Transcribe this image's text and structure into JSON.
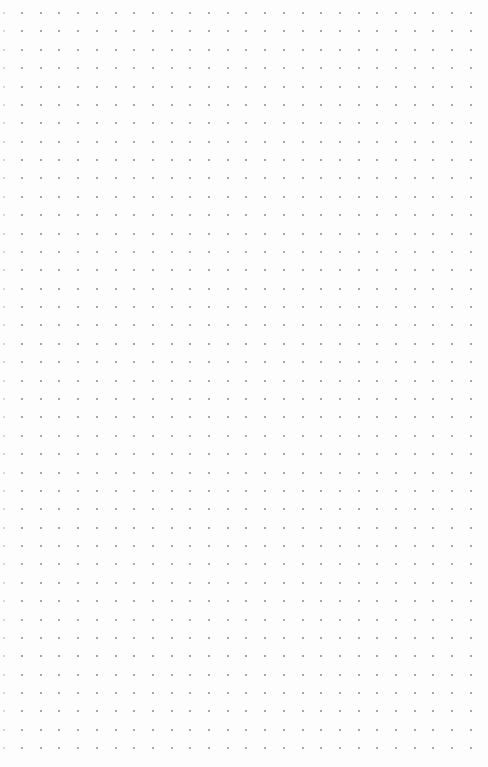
{
  "page": {
    "type": "dot-grid-paper",
    "background_color": "#fdfdfd",
    "dot_color": "#8a8a8a",
    "grid": {
      "origin_x": 22,
      "origin_y": 13,
      "spacing_x": 18.7,
      "spacing_y": 18.38,
      "columns": 25,
      "rows": 41
    }
  }
}
